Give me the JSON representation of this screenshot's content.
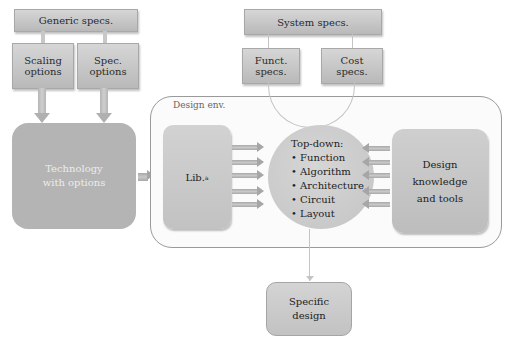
{
  "diagram": {
    "generic_specs": {
      "label": "Generic specs."
    },
    "scaling_options": {
      "label": "Scaling\noptions",
      "line1": "Scaling",
      "line2": "options"
    },
    "spec_options": {
      "line1": "Spec.",
      "line2": "options"
    },
    "system_specs": {
      "label": "System specs."
    },
    "funct_specs": {
      "line1": "Funct.",
      "line2": "specs."
    },
    "cost_specs": {
      "line1": "Cost",
      "line2": "specs."
    },
    "technology": {
      "line1": "Technology",
      "line2": "with options"
    },
    "design_env": {
      "label": "Design env."
    },
    "library": {
      "label": "Lib.",
      "superscript": "a"
    },
    "top_down": {
      "title": "Top-down:",
      "items": [
        "Function",
        "Algorithm",
        "Architecture",
        "Circuit",
        "Layout"
      ]
    },
    "design_knowledge": {
      "line1": "Design",
      "line2": "knowledge",
      "line3": "and tools"
    },
    "specific_design": {
      "line1": "Specific",
      "line2": "design"
    }
  },
  "colors": {
    "box_fill": "#c6c6c6",
    "technology_fill": "#b4b4b4",
    "technology_text": "#ececec",
    "env_border": "#9a9a9a",
    "arrow": "#a8a8a8"
  }
}
